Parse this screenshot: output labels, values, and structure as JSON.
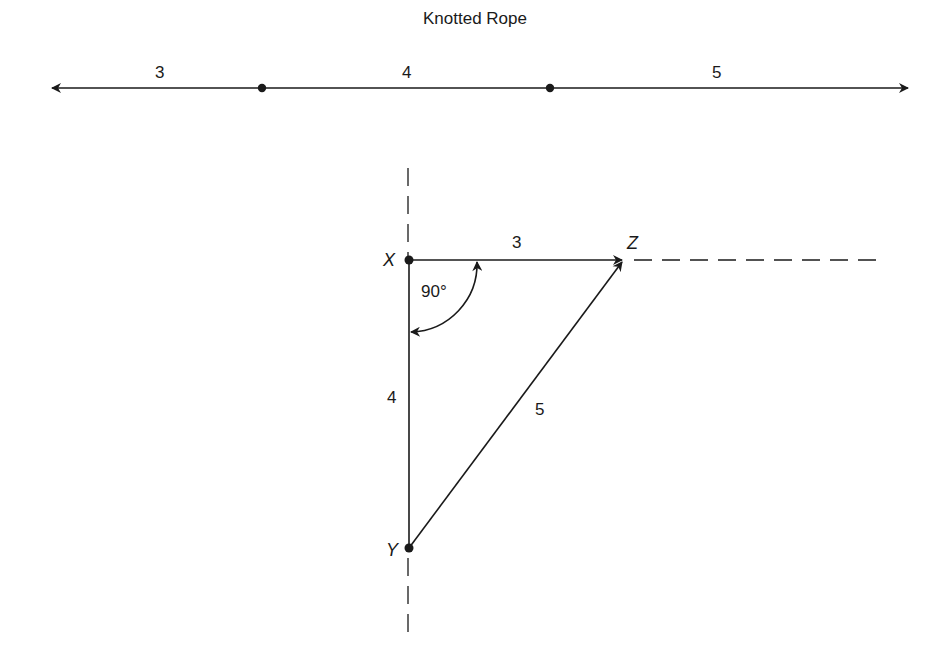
{
  "rope": {
    "title": "Knotted Rope",
    "segments": [
      {
        "label": "3",
        "length": 3
      },
      {
        "label": "4",
        "length": 4
      },
      {
        "label": "5",
        "length": 5
      }
    ]
  },
  "triangle": {
    "vertices": {
      "x": "X",
      "y": "Y",
      "z": "Z"
    },
    "sides": {
      "xz": "3",
      "xy": "4",
      "yz": "5"
    },
    "angle_label": "90°"
  },
  "colors": {
    "line": "#1a1a1a",
    "background": "#ffffff"
  }
}
